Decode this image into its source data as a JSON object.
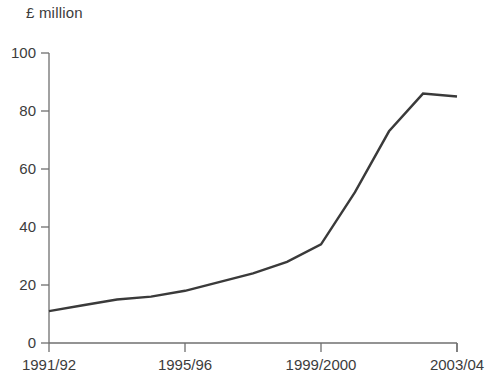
{
  "chart_data": {
    "type": "line",
    "title": "",
    "ylabel": "£ million",
    "xlabel": "",
    "ylim": [
      0,
      100
    ],
    "y_ticks": [
      "0",
      "20",
      "40",
      "60",
      "80",
      "100"
    ],
    "y_tick_values": [
      0,
      20,
      40,
      60,
      80,
      100
    ],
    "grid": false,
    "legend": "none",
    "x_tick_labels": [
      "1991/92",
      "1995/96",
      "1999/2000",
      "2003/04"
    ],
    "x_tick_positions": [
      0,
      4,
      8,
      12
    ],
    "categories": [
      "1991/92",
      "1992/93",
      "1993/94",
      "1994/95",
      "1995/96",
      "1996/97",
      "1997/98",
      "1998/99",
      "1999/2000",
      "2000/01",
      "2001/02",
      "2002/03",
      "2003/04"
    ],
    "series": [
      {
        "name": "£ million",
        "color": "#3a3a3a",
        "values": [
          11,
          13,
          15,
          16,
          18,
          21,
          24,
          28,
          34,
          52,
          73,
          86,
          85
        ]
      }
    ]
  },
  "axes": {
    "y_axis_title": "£ million",
    "axis_color": "#6f6f6f"
  }
}
